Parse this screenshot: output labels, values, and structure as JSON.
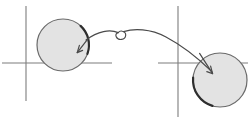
{
  "figure": {
    "title": "Two coordinate frames with disks joined by a looping arrow",
    "width": 250,
    "height": 121,
    "background_color": "#ffffff",
    "caption": ""
  },
  "style": {
    "axis_color": "#7d7d7d",
    "axis_width": 1.1,
    "disk_fill": "#e3e3e3",
    "disk_stroke": "#6a6a6a",
    "disk_stroke_width": 1.2,
    "highlight_arc_color": "#2e2e2e",
    "highlight_arc_width": 2.2,
    "curve_color": "#4a4a4a",
    "curve_width": 1.2,
    "arrow_color": "#4a4a4a",
    "loop_color": "#4a4a4a"
  },
  "axes": [
    {
      "name": "left-axes",
      "x_axis": {
        "x1": 2,
        "y1": 63,
        "x2": 112,
        "y2": 63,
        "label": ""
      },
      "y_axis": {
        "x1": 26,
        "y1": 6,
        "x2": 26,
        "y2": 101,
        "label": ""
      },
      "origin": {
        "x": 26,
        "y": 63
      }
    },
    {
      "name": "right-axes",
      "x_axis": {
        "x1": 158,
        "y1": 63,
        "x2": 248,
        "y2": 63,
        "label": ""
      },
      "y_axis": {
        "x1": 178,
        "y1": 6,
        "x2": 178,
        "y2": 117,
        "label": ""
      },
      "origin": {
        "x": 178,
        "y": 63
      }
    }
  ],
  "disks": [
    {
      "name": "left-disk",
      "cx": 63,
      "cy": 45,
      "r": 26,
      "label": "",
      "highlight_arc": {
        "start_deg": -70,
        "end_deg": -20,
        "description": "upper-right boundary arc"
      }
    },
    {
      "name": "right-disk",
      "cx": 220,
      "cy": 80,
      "r": 27,
      "label": "",
      "highlight_arc": {
        "start_deg": 175,
        "end_deg": 95,
        "description": "lower-left boundary arc"
      }
    }
  ],
  "connector": {
    "name": "looping-arrow",
    "description": "Curved arc from the right side of the left disk, over a small loop, down into the right disk",
    "start": {
      "x": 88,
      "y": 39
    },
    "end": {
      "x": 213,
      "y": 73
    },
    "peak": {
      "x": 140,
      "y": 31
    },
    "loop": {
      "cx": 122,
      "cy": 34,
      "rx": 4.5,
      "ry": 4.5
    },
    "arrowheads": [
      {
        "name": "left-arrowhead",
        "x": 78,
        "y": 52,
        "direction_deg": 225,
        "target": "left-disk"
      },
      {
        "name": "right-arrowhead",
        "x": 213,
        "y": 74,
        "direction_deg": 60,
        "target": "right-disk"
      }
    ]
  },
  "annotations": []
}
